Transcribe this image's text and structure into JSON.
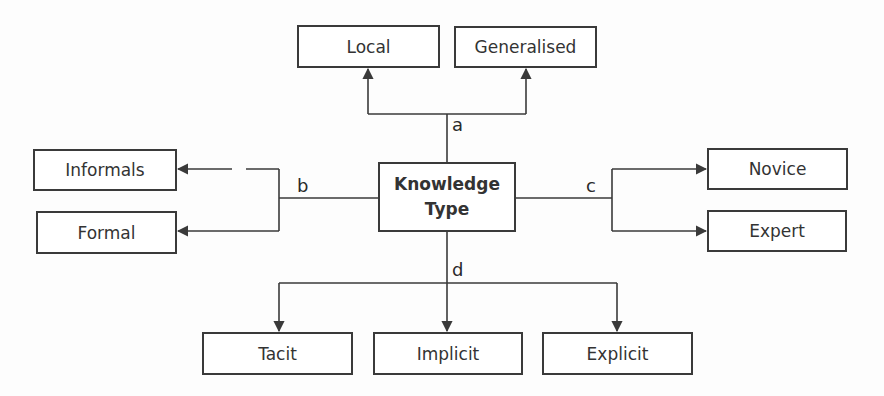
{
  "diagram": {
    "center": {
      "line1": "Knowledge",
      "line2": "Type"
    },
    "branches": {
      "a": {
        "label": "a",
        "children": [
          "Local",
          "Generalised"
        ]
      },
      "b": {
        "label": "b",
        "children": [
          "Informals",
          "Formal"
        ]
      },
      "c": {
        "label": "c",
        "children": [
          "Novice",
          "Expert"
        ]
      },
      "d": {
        "label": "d",
        "children": [
          "Tacit",
          "Implicit",
          "Explicit"
        ]
      }
    },
    "colors": {
      "line": "#3a3a3a",
      "box_border": "#3a3a3a",
      "text": "#333333",
      "background": "#fdfdfd"
    }
  }
}
